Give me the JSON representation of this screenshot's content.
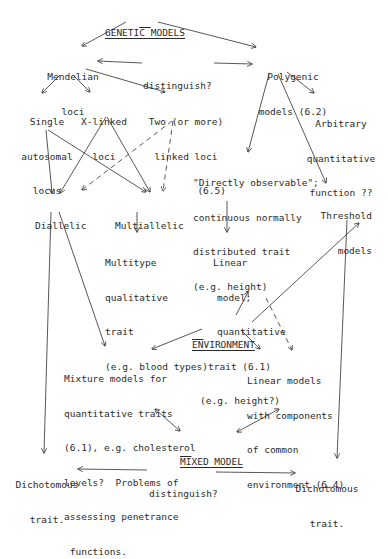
{
  "diagram": {
    "title": "GENETIC MODELS",
    "nodes": {
      "genetic_models": [
        "GENETIC MODELS"
      ],
      "mendelian": [
        "Mendelian",
        "loci"
      ],
      "distinguish_top": [
        "distinguish?"
      ],
      "polygenic": [
        "Polygenic",
        "models (6.2)"
      ],
      "single_autosomal": [
        "Single",
        "autosomal",
        "locus"
      ],
      "x_linked": [
        "X-linked",
        "loci"
      ],
      "two_linked": [
        "Two (or more)",
        "linked loci",
        "(6.5)"
      ],
      "arbitrary": [
        "Arbitrary",
        "quantitative",
        "function ??"
      ],
      "directly_observable": [
        "\"Directly observable\";",
        "continuous normally",
        "distributed trait",
        "(e.g. height)"
      ],
      "dialleic": [
        "Diallelic"
      ],
      "multiallelic": [
        "Multiallelic"
      ],
      "threshold": [
        "Threshold",
        "models"
      ],
      "multitype": [
        "Multitype",
        "qualitative",
        "trait",
        "(e.g. blood types)"
      ],
      "linear_model": [
        "Linear",
        "model;",
        "quantitative",
        "trait (6.1)",
        "(e.g. height?)"
      ],
      "environment": [
        "ENVIRONMENT"
      ],
      "mixture": [
        "Mixture models for",
        "quantitative traits",
        "(6.1), e.g. cholesterol",
        "levels?  Problems of",
        "assessing penetrance",
        " functions."
      ],
      "linear_env": [
        "Linear models",
        "with components",
        "of common",
        "environment (6.4)"
      ],
      "mixed_model": [
        "MIXED MODEL"
      ],
      "dichotomous_left": [
        "Dichotomous",
        "trait."
      ],
      "distinguish_bottom": [
        "distinguish?"
      ],
      "dichotomous_right": [
        "Dichotomous",
        "trait."
      ]
    },
    "edges": [
      {
        "from": "genetic_models",
        "to": "mendelian",
        "style": "solid"
      },
      {
        "from": "genetic_models",
        "to": "polygenic",
        "style": "solid"
      },
      {
        "from": "distinguish_top",
        "to": "mendelian",
        "style": "solid"
      },
      {
        "from": "distinguish_top",
        "to": "polygenic",
        "style": "solid"
      },
      {
        "from": "mendelian",
        "to": "single_autosomal",
        "style": "solid"
      },
      {
        "from": "mendelian",
        "to": "x_linked",
        "style": "solid"
      },
      {
        "from": "mendelian",
        "to": "two_linked",
        "style": "solid"
      },
      {
        "from": "polygenic",
        "to": "directly_observable",
        "style": "solid"
      },
      {
        "from": "polygenic",
        "to": "threshold",
        "style": "solid"
      },
      {
        "from": "polygenic",
        "to": "arbitrary",
        "style": "solid"
      },
      {
        "from": "single_autosomal",
        "to": "dialleic",
        "style": "solid"
      },
      {
        "from": "single_autosomal",
        "to": "multiallelic",
        "style": "solid"
      },
      {
        "from": "x_linked",
        "to": "dialleic",
        "style": "solid"
      },
      {
        "from": "x_linked",
        "to": "multiallelic",
        "style": "solid"
      },
      {
        "from": "two_linked",
        "to": "dialleic",
        "style": "dashed"
      },
      {
        "from": "two_linked",
        "to": "multiallelic",
        "style": "dashed"
      },
      {
        "from": "multiallelic",
        "to": "multitype",
        "style": "solid"
      },
      {
        "from": "directly_observable",
        "to": "linear_model",
        "style": "solid"
      },
      {
        "from": "dialleic",
        "to": "dichotomous_left",
        "style": "solid"
      },
      {
        "from": "dialleic",
        "to": "mixture",
        "style": "solid"
      },
      {
        "from": "environment",
        "to": "linear_model",
        "style": "solid"
      },
      {
        "from": "environment",
        "to": "threshold",
        "style": "solid"
      },
      {
        "from": "environment",
        "to": "mixture",
        "style": "solid"
      },
      {
        "from": "environment",
        "to": "linear_env",
        "style": "solid"
      },
      {
        "from": "polygenic",
        "to": "linear_env",
        "style": "dashed"
      },
      {
        "from": "mixture",
        "to": "mixed_model",
        "style": "double-arrow"
      },
      {
        "from": "linear_env",
        "to": "mixed_model",
        "style": "double-arrow"
      },
      {
        "from": "threshold",
        "to": "dichotomous_right",
        "style": "solid"
      },
      {
        "from": "distinguish_bottom",
        "to": "dichotomous_left",
        "style": "solid"
      },
      {
        "from": "distinguish_bottom",
        "to": "dichotomous_right",
        "style": "solid"
      }
    ],
    "colors": {
      "ink": "#2a2a2a",
      "background": "#ffffff"
    }
  }
}
